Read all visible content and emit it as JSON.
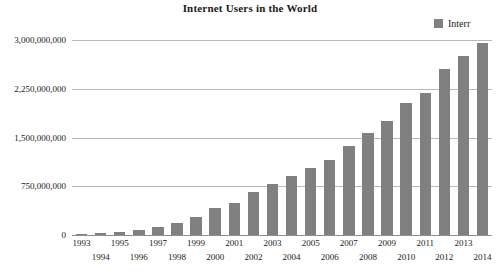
{
  "chart_data": {
    "type": "bar",
    "title": "Internet Users in the World",
    "xlabel": "",
    "ylabel": "",
    "ylim": [
      0,
      3000000000
    ],
    "grid": true,
    "legend_position": "top-right",
    "legend": [
      "Interr"
    ],
    "series": [
      {
        "name": "Interr",
        "color": "#808080",
        "values": [
          14000000,
          25000000,
          40000000,
          77000000,
          120000000,
          188000000,
          281000000,
          414000000,
          500000000,
          663000000,
          782000000,
          913000000,
          1030000000,
          1160000000,
          1370000000,
          1570000000,
          1750000000,
          2030000000,
          2180000000,
          2550000000,
          2760000000,
          2950000000
        ]
      }
    ],
    "categories": [
      "1993",
      "1994",
      "1995",
      "1996",
      "1997",
      "1998",
      "1999",
      "2000",
      "2001",
      "2002",
      "2003",
      "2004",
      "2005",
      "2006",
      "2007",
      "2008",
      "2009",
      "2010",
      "2011",
      "2012",
      "2013",
      "2014"
    ],
    "ytick_labels": [
      "0",
      "750,000,000",
      "1,500,000,000",
      "2,250,000,000",
      "3,000,000,000"
    ],
    "ytick_values": [
      0,
      750000000,
      1500000000,
      2250000000,
      3000000000
    ]
  }
}
